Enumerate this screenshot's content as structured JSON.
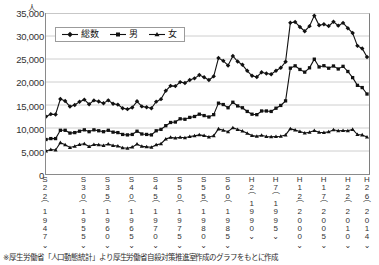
{
  "chart_data": {
    "type": "line",
    "title": "",
    "subtitle": "",
    "xlabel": "",
    "ylabel": "",
    "y_unit": "人",
    "ylim": [
      0,
      35000
    ],
    "ytick_values": [
      0,
      5000,
      10000,
      15000,
      20000,
      25000,
      30000,
      35000
    ],
    "ytick_labels": [
      "0",
      "5,000",
      "10,000",
      "15,000",
      "20,000",
      "25,000",
      "30,000",
      "35,000"
    ],
    "grid": true,
    "legend_position": "top-left-inside",
    "xtick_labels": [
      {
        "era": "S22",
        "year": "(1947)"
      },
      {
        "era": "S30",
        "year": "(1955)"
      },
      {
        "era": "S35",
        "year": "(1960)"
      },
      {
        "era": "S40",
        "year": "(1965)"
      },
      {
        "era": "S45",
        "year": "(1970)"
      },
      {
        "era": "S50",
        "year": "(1975)"
      },
      {
        "era": "S55",
        "year": "(1980)"
      },
      {
        "era": "S60",
        "year": "(1985)"
      },
      {
        "era": "H2",
        "year": "(1990)"
      },
      {
        "era": "H7",
        "year": "(1995)"
      },
      {
        "era": "H12",
        "year": "(2000)"
      },
      {
        "era": "H17",
        "year": "(2005)"
      },
      {
        "era": "H22",
        "year": "(2010)"
      },
      {
        "era": "H26",
        "year": "(2014)"
      }
    ],
    "x": [
      1947,
      1948,
      1949,
      1950,
      1951,
      1952,
      1953,
      1954,
      1955,
      1956,
      1957,
      1958,
      1959,
      1960,
      1961,
      1962,
      1963,
      1964,
      1965,
      1966,
      1967,
      1968,
      1969,
      1970,
      1971,
      1972,
      1973,
      1974,
      1975,
      1976,
      1977,
      1978,
      1979,
      1980,
      1981,
      1982,
      1983,
      1984,
      1985,
      1986,
      1987,
      1988,
      1989,
      1990,
      1991,
      1992,
      1993,
      1994,
      1995,
      1996,
      1997,
      1998,
      1999,
      2000,
      2001,
      2002,
      2003,
      2004,
      2005,
      2006,
      2007,
      2008,
      2009,
      2010,
      2011,
      2012,
      2013,
      2014
    ],
    "series": [
      {
        "name": "総数",
        "marker": "diamond",
        "color": "#111111",
        "values": [
          12478,
          13013,
          12932,
          16311,
          15859,
          14655,
          15018,
          15701,
          16163,
          15161,
          16000,
          15756,
          15390,
          16008,
          15277,
          15080,
          14300,
          14100,
          14444,
          15800,
          14700,
          14500,
          14300,
          15728,
          16274,
          18095,
          19163,
          19105,
          19975,
          19786,
          20436,
          20788,
          21503,
          21048,
          20434,
          21228,
          25202,
          24596,
          23599,
          25667,
          24460,
          23742,
          22436,
          21346,
          21084,
          22104,
          21851,
          21679,
          22445,
          23104,
          24391,
          32863,
          33048,
          31957,
          31042,
          32143,
          34427,
          32325,
          32552,
          32155,
          33093,
          32249,
          32845,
          31690,
          30651,
          27858,
          27283,
          25427
        ]
      },
      {
        "name": "男",
        "marker": "square",
        "color": "#111111",
        "values": [
          7500,
          7700,
          7700,
          9500,
          9500,
          8900,
          9000,
          9300,
          9600,
          9200,
          9600,
          9400,
          9200,
          9500,
          9100,
          9000,
          8600,
          8500,
          8600,
          9300,
          8700,
          8600,
          8500,
          9400,
          9700,
          10500,
          11200,
          11300,
          12000,
          11900,
          12300,
          12500,
          13000,
          12700,
          12400,
          12900,
          15400,
          15100,
          14400,
          15600,
          14800,
          14400,
          13600,
          13000,
          12900,
          13700,
          13700,
          13600,
          14300,
          14900,
          15900,
          23013,
          23512,
          22727,
          22144,
          23080,
          24963,
          23272,
          23540,
          23000,
          23478,
          22831,
          23406,
          22283,
          20955,
          19273,
          18787,
          17386
        ]
      },
      {
        "name": "女",
        "marker": "triangle",
        "color": "#111111",
        "values": [
          4978,
          5313,
          5232,
          6811,
          6359,
          5755,
          6018,
          6401,
          6563,
          5961,
          6400,
          6356,
          6190,
          6508,
          6177,
          6080,
          5700,
          5600,
          5844,
          6500,
          6000,
          5900,
          5800,
          6328,
          6574,
          7595,
          7963,
          7805,
          7975,
          7886,
          8136,
          8288,
          8503,
          8348,
          8034,
          8328,
          9802,
          9496,
          9199,
          10067,
          9660,
          9342,
          8836,
          8346,
          8184,
          8404,
          8151,
          8079,
          8145,
          8204,
          8491,
          9850,
          9536,
          9230,
          8898,
          9063,
          9464,
          9053,
          9012,
          9155,
          9615,
          9418,
          9439,
          9407,
          9696,
          8585,
          8496,
          8041
        ]
      }
    ]
  },
  "footnote": "※厚生労働省「人口動態統計」より厚生労働省自殺対策推進室作成のグラフをもとに作成",
  "legend": {
    "items": [
      {
        "label": "総数",
        "marker": "diamond"
      },
      {
        "label": "男",
        "marker": "square"
      },
      {
        "label": "女",
        "marker": "triangle"
      }
    ]
  }
}
